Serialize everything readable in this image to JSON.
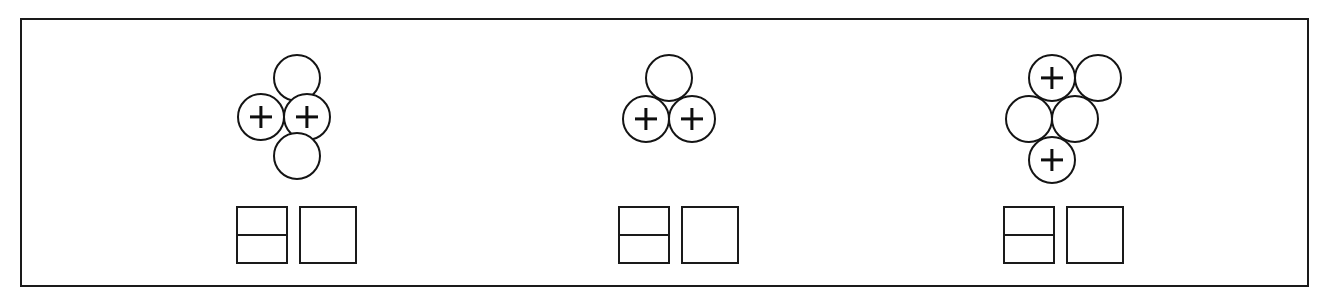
{
  "figure": {
    "background_color": "#ffffff",
    "stroke_color": "#1a1a1a",
    "frame": {
      "x": 20,
      "y": 18,
      "width": 1289,
      "height": 269,
      "border_width": 2
    },
    "marker_label": "+",
    "circle_diameter": 48,
    "groups": [
      {
        "id": "group-1",
        "name": "four-circle-diamond-cluster",
        "arrangement": "diamond",
        "circle_count": 4,
        "marked_count": 2,
        "unmarked_count": 2,
        "circles": [
          {
            "id": "g1-c1",
            "position": "top",
            "marked": false,
            "label": "",
            "x": 36,
            "y": 0
          },
          {
            "id": "g1-c2",
            "position": "middle-left",
            "marked": true,
            "label": "+",
            "x": 0,
            "y": 39
          },
          {
            "id": "g1-c3",
            "position": "middle-right",
            "marked": true,
            "label": "+",
            "x": 46,
            "y": 39
          },
          {
            "id": "g1-c4",
            "position": "bottom",
            "marked": false,
            "label": "",
            "x": 36,
            "y": 78
          }
        ],
        "cluster_origin": {
          "x": 235,
          "y": 52
        },
        "boxes": {
          "origin": {
            "x": 234,
            "y": 204
          },
          "split_box": {
            "width": 52,
            "height": 58,
            "rows": 2,
            "shaded": [
              false,
              false
            ]
          },
          "single_box": {
            "width": 58,
            "height": 58,
            "gap": 11,
            "shaded": false
          }
        }
      },
      {
        "id": "group-2",
        "name": "three-circle-triangle-cluster",
        "arrangement": "triangle",
        "circle_count": 3,
        "marked_count": 2,
        "unmarked_count": 1,
        "circles": [
          {
            "id": "g2-c1",
            "position": "top",
            "marked": false,
            "label": "",
            "x": 23,
            "y": 0
          },
          {
            "id": "g2-c2",
            "position": "bottom-left",
            "marked": true,
            "label": "+",
            "x": 0,
            "y": 41
          },
          {
            "id": "g2-c3",
            "position": "bottom-right",
            "marked": true,
            "label": "+",
            "x": 46,
            "y": 41
          }
        ],
        "cluster_origin": {
          "x": 620,
          "y": 52
        },
        "boxes": {
          "origin": {
            "x": 616,
            "y": 204
          },
          "split_box": {
            "width": 52,
            "height": 58,
            "rows": 2,
            "shaded": [
              false,
              false
            ]
          },
          "single_box": {
            "width": 58,
            "height": 58,
            "gap": 11,
            "shaded": false
          }
        }
      },
      {
        "id": "group-3",
        "name": "five-circle-offset-cluster",
        "arrangement": "offset-stack",
        "circle_count": 5,
        "marked_count": 2,
        "unmarked_count": 3,
        "circles": [
          {
            "id": "g3-c1",
            "position": "top-left",
            "marked": true,
            "label": "+",
            "x": 23,
            "y": 0
          },
          {
            "id": "g3-c2",
            "position": "top-right",
            "marked": false,
            "label": "",
            "x": 69,
            "y": 0
          },
          {
            "id": "g3-c3",
            "position": "middle-left",
            "marked": false,
            "label": "",
            "x": 0,
            "y": 41
          },
          {
            "id": "g3-c4",
            "position": "middle-right",
            "marked": false,
            "label": "",
            "x": 46,
            "y": 41
          },
          {
            "id": "g3-c5",
            "position": "bottom",
            "marked": true,
            "label": "+",
            "x": 23,
            "y": 82
          }
        ],
        "cluster_origin": {
          "x": 1003,
          "y": 52
        },
        "boxes": {
          "origin": {
            "x": 1001,
            "y": 204
          },
          "split_box": {
            "width": 52,
            "height": 58,
            "rows": 2,
            "shaded": [
              false,
              false
            ]
          },
          "single_box": {
            "width": 58,
            "height": 58,
            "gap": 11,
            "shaded": false
          }
        }
      }
    ]
  }
}
